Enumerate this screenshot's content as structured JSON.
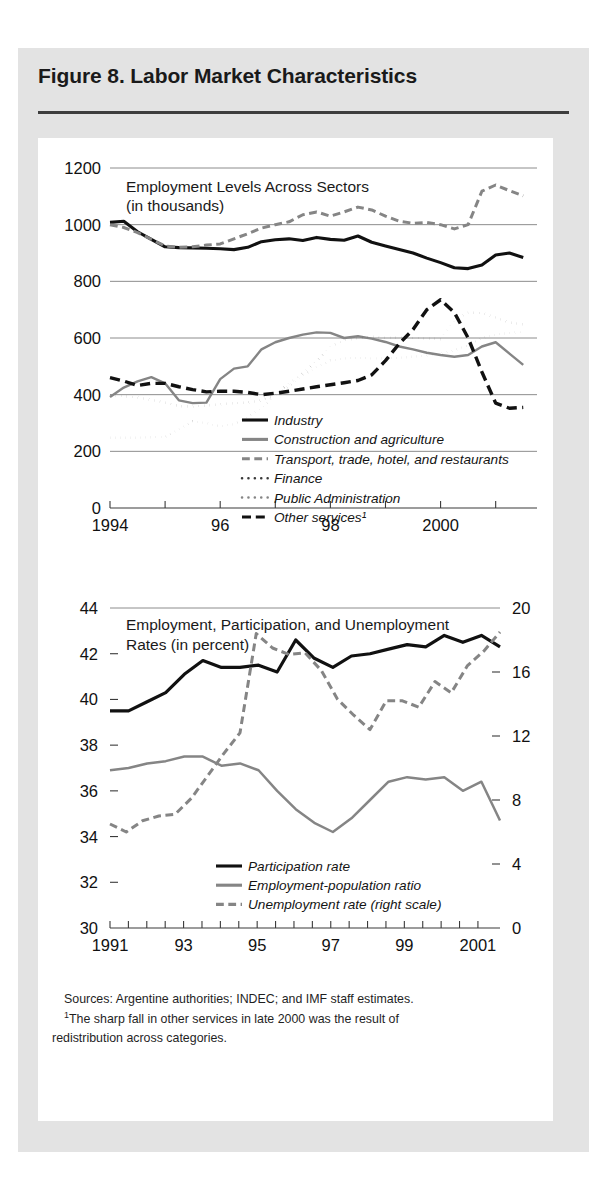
{
  "figure": {
    "title": "Figure 8. Labor Market Characteristics"
  },
  "notes": {
    "sources": "Sources: Argentine authorities; INDEC; and IMF staff estimates.",
    "footnote_marker": "1",
    "footnote_line1": "The sharp fall in other services in late 2000 was the result of",
    "footnote_line2": "redistribution across categories."
  },
  "colors": {
    "page_background": "#ffffff",
    "figure_background": "#e3e3e3",
    "panel_background": "#ffffff",
    "gridline": "#8c8c8c",
    "axis": "#3a3a3a",
    "dark_series": "#111111",
    "gray_series": "#858585",
    "text": "#1a1a1a"
  },
  "chart_data": [
    {
      "id": "employment-levels",
      "type": "line",
      "title": "Employment Levels Across Sectors",
      "subtitle": "(in thousands)",
      "xlabel": "",
      "ylabel": "",
      "grid": true,
      "legend_position": "inside-bottom-center",
      "xlim": [
        1994,
        2001.75
      ],
      "ylim": [
        0,
        1200
      ],
      "yticks": [
        0,
        200,
        400,
        600,
        800,
        1000,
        1200
      ],
      "xticks": [
        1994,
        1995,
        1996,
        1997,
        1998,
        1999,
        2000,
        2001
      ],
      "xtick_labels": [
        "1994",
        "",
        "96",
        "",
        "98",
        "",
        "2000",
        ""
      ],
      "x": [
        1994.0,
        1994.25,
        1994.5,
        1994.75,
        1995.0,
        1995.25,
        1995.5,
        1995.75,
        1996.0,
        1996.25,
        1996.5,
        1996.75,
        1997.0,
        1997.25,
        1997.5,
        1997.75,
        1998.0,
        1998.25,
        1998.5,
        1998.75,
        1999.0,
        1999.25,
        1999.5,
        1999.75,
        2000.0,
        2000.25,
        2000.5,
        2000.75,
        2001.0,
        2001.25,
        2001.5
      ],
      "series": [
        {
          "name": "Industry",
          "style": "solid",
          "color": "#111111",
          "width": 3.1,
          "values": [
            1008,
            1012,
            975,
            948,
            922,
            919,
            918,
            917,
            915,
            912,
            920,
            940,
            947,
            950,
            944,
            955,
            948,
            945,
            960,
            938,
            925,
            912,
            900,
            882,
            866,
            848,
            845,
            858,
            893,
            900,
            884
          ]
        },
        {
          "name": "Construction and agriculture",
          "style": "solid",
          "color": "#858585",
          "width": 2.4,
          "values": [
            392,
            425,
            447,
            462,
            440,
            380,
            370,
            372,
            455,
            492,
            500,
            560,
            585,
            600,
            612,
            620,
            618,
            600,
            606,
            598,
            586,
            570,
            560,
            548,
            540,
            534,
            540,
            570,
            585,
            545,
            505
          ]
        },
        {
          "name": "Transport, trade, hotel, and restaurants",
          "style": "dashed",
          "color": "#858585",
          "width": 3.0,
          "values": [
            1000,
            990,
            972,
            948,
            925,
            920,
            922,
            928,
            932,
            950,
            968,
            988,
            1000,
            1010,
            1035,
            1045,
            1030,
            1045,
            1062,
            1052,
            1030,
            1012,
            1005,
            1008,
            1000,
            985,
            1000,
            1118,
            1140,
            1120,
            1102
          ]
        },
        {
          "name": "Finance",
          "style": "dotted",
          "color": "#3a3a3a",
          "width": 2.6,
          "values": [
            398,
            395,
            390,
            382,
            372,
            360,
            358,
            362,
            366,
            370,
            372,
            380,
            400,
            440,
            475,
            520,
            570,
            592,
            600,
            605,
            600,
            602,
            600,
            598,
            596,
            662,
            690,
            688,
            672,
            655,
            648
          ]
        },
        {
          "name": "Public Administration",
          "style": "dotted",
          "color": "#858585",
          "width": 2.4,
          "values": [
            248,
            248,
            248,
            250,
            250,
            278,
            305,
            300,
            288,
            296,
            322,
            352,
            400,
            430,
            468,
            498,
            520,
            528,
            530,
            528,
            528,
            530,
            534,
            538,
            545,
            556,
            575,
            600,
            612,
            618,
            622
          ]
        },
        {
          "name": "Other services",
          "style": "longdash",
          "color": "#111111",
          "width": 3.4,
          "values": [
            460,
            448,
            432,
            440,
            440,
            428,
            418,
            410,
            412,
            412,
            408,
            400,
            405,
            412,
            420,
            428,
            435,
            442,
            450,
            470,
            520,
            580,
            630,
            700,
            735,
            690,
            600,
            480,
            370,
            352,
            355
          ]
        }
      ],
      "legend": [
        {
          "label": "Industry",
          "style": "solid",
          "color": "#111111"
        },
        {
          "label": "Construction and agriculture",
          "style": "solid",
          "color": "#858585"
        },
        {
          "label": "Transport, trade, hotel, and restaurants",
          "style": "dashed",
          "color": "#858585"
        },
        {
          "label": "Finance",
          "style": "dotted",
          "color": "#3a3a3a"
        },
        {
          "label": "Public Administration",
          "style": "dotted",
          "color": "#858585"
        },
        {
          "label": "Other services¹",
          "style": "longdash",
          "color": "#111111"
        }
      ]
    },
    {
      "id": "rates",
      "type": "line",
      "title": "Employment, Participation, and Unemployment",
      "subtitle": "Rates (in percent)",
      "xlabel": "",
      "ylabel": "",
      "grid": false,
      "legend_position": "inside-bottom-center",
      "xlim": [
        1991,
        2001.6
      ],
      "ylim": [
        30,
        44
      ],
      "yticks": [
        30,
        32,
        34,
        36,
        38,
        40,
        42,
        44
      ],
      "ylim_right": [
        0,
        20
      ],
      "yticks_right": [
        0,
        4,
        8,
        12,
        16,
        20
      ],
      "xticks": [
        1991,
        1991.5,
        1992,
        1992.5,
        1993,
        1993.5,
        1994,
        1994.5,
        1995,
        1995.5,
        1996,
        1996.5,
        1997,
        1997.5,
        1998,
        1998.5,
        1999,
        1999.5,
        2000,
        2000.5,
        2001
      ],
      "xtick_labels": [
        "1991",
        "",
        "",
        "",
        "93",
        "",
        "",
        "",
        "95",
        "",
        "",
        "",
        "97",
        "",
        "",
        "",
        "99",
        "",
        "",
        "",
        "2001"
      ],
      "x": [
        1991.0,
        1991.5,
        1992.0,
        1992.5,
        1993.0,
        1993.5,
        1994.0,
        1994.5,
        1995.0,
        1995.5,
        1996.0,
        1996.5,
        1997.0,
        1997.5,
        1998.0,
        1998.5,
        1999.0,
        1999.5,
        2000.0,
        2000.5,
        2001.0,
        2001.5
      ],
      "series": [
        {
          "name": "Participation rate",
          "style": "solid",
          "color": "#111111",
          "width": 3.2,
          "axis": "left",
          "values": [
            39.5,
            39.5,
            39.9,
            40.3,
            41.1,
            41.7,
            41.4,
            41.4,
            41.5,
            41.2,
            42.6,
            41.8,
            41.4,
            41.9,
            42.0,
            42.2,
            42.4,
            42.3,
            42.8,
            42.5,
            42.8,
            42.3
          ]
        },
        {
          "name": "Employment-population ratio",
          "style": "solid",
          "color": "#858585",
          "width": 2.5,
          "axis": "left",
          "values": [
            36.9,
            37.0,
            37.2,
            37.3,
            37.5,
            37.5,
            37.1,
            37.2,
            36.9,
            36.0,
            35.2,
            34.6,
            34.2,
            34.8,
            35.6,
            36.4,
            36.6,
            36.5,
            36.6,
            36.0,
            36.4,
            34.7
          ]
        },
        {
          "name": "Unemployment rate (right scale)",
          "style": "dashed",
          "color": "#858585",
          "width": 3.0,
          "axis": "right",
          "values": [
            6.5,
            6.0,
            6.7,
            7.0,
            7.1,
            8.1,
            9.5,
            10.9,
            12.2,
            18.4,
            17.5,
            17.1,
            17.2,
            16.1,
            14.3,
            13.3,
            12.4,
            14.2,
            14.2,
            13.8,
            15.4,
            14.7,
            16.4,
            17.3,
            18.5
          ]
        }
      ],
      "legend": [
        {
          "label": "Participation rate",
          "style": "solid",
          "color": "#111111"
        },
        {
          "label": "Employment-population ratio",
          "style": "solid",
          "color": "#858585"
        },
        {
          "label": "Unemployment rate (right scale)",
          "style": "dashed",
          "color": "#858585"
        }
      ]
    }
  ]
}
